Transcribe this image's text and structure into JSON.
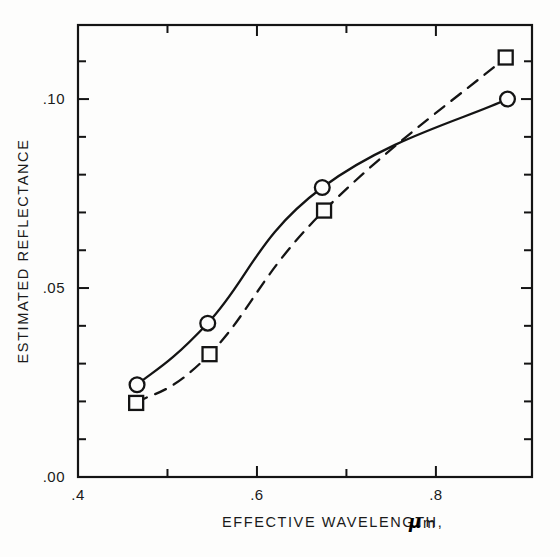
{
  "chart_data": {
    "type": "line",
    "title": "",
    "xlabel": "EFFECTIVE WAVELENGTH,",
    "xlabel_unit_symbol": "μ",
    "xlabel_unit_suffix": "m",
    "ylabel": "ESTIMATED REFLECTANCE",
    "xlim": [
      0.4,
      0.9074
    ],
    "ylim": [
      0.0,
      0.1196
    ],
    "grid": false,
    "legend": "none",
    "x_major_ticks": [
      0.4,
      0.6,
      0.8
    ],
    "x_major_tick_labels": [
      ".4",
      ".6",
      ".8"
    ],
    "x_minor_ticks": [
      0.5,
      0.7
    ],
    "y_major_ticks": [
      0.0,
      0.05,
      0.1
    ],
    "y_major_tick_labels": [
      ".00",
      ".05",
      ".10"
    ],
    "y_minor_ticks": [
      0.01,
      0.02,
      0.03,
      0.04,
      0.06,
      0.07,
      0.08,
      0.09,
      0.11
    ],
    "series": [
      {
        "name": "circle-series",
        "marker": "circle",
        "linestyle": "solid",
        "color": "#141414",
        "x": [
          0.466,
          0.545,
          0.673,
          0.88
        ],
        "y": [
          0.0244,
          0.0407,
          0.0766,
          0.1
        ]
      },
      {
        "name": "square-series",
        "marker": "square",
        "linestyle": "dashed",
        "color": "#141414",
        "x": [
          0.465,
          0.547,
          0.675,
          0.878
        ],
        "y": [
          0.0196,
          0.0325,
          0.0705,
          0.111
        ]
      }
    ]
  },
  "axes": {
    "frame_color": "#141414",
    "x_tick_labels": [
      {
        "value": 0.4,
        "text": ".4"
      },
      {
        "value": 0.6,
        "text": ".6"
      },
      {
        "value": 0.8,
        "text": ".8"
      }
    ],
    "y_tick_labels": [
      {
        "value": 0.0,
        "text": ".00"
      },
      {
        "value": 0.05,
        "text": ".05"
      },
      {
        "value": 0.1,
        "text": ".10"
      }
    ]
  },
  "labels": {
    "x_axis_title": "EFFECTIVE WAVELENGTH,",
    "x_axis_unit": "m",
    "x_axis_mu": "μ",
    "y_axis_title": "ESTIMATED REFLECTANCE"
  }
}
